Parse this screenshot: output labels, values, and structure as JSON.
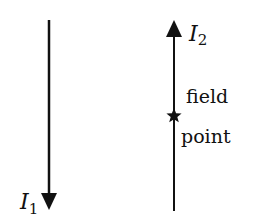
{
  "diagram": {
    "wire1": {
      "label_main": "I",
      "label_sub": "1",
      "direction": "down"
    },
    "wire2": {
      "label_main": "I",
      "label_sub": "2",
      "direction": "up"
    },
    "field_point": {
      "line1": "field",
      "line2": "point",
      "marker": "star"
    },
    "colors": {
      "line": "#111111",
      "background": "#ffffff"
    }
  }
}
